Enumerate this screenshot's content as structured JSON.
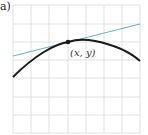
{
  "figure": {
    "panel_label": "a)",
    "point_label": "(x, y)",
    "colors": {
      "grid": "#d9d9d9",
      "curve": "#1a1a1a",
      "tangent": "#6fa9c9",
      "point": "#1a1a1a"
    },
    "grid": {
      "columns": 7,
      "rows": 7
    },
    "elements": [
      "curve",
      "tangent-line",
      "point-of-tangency"
    ]
  }
}
